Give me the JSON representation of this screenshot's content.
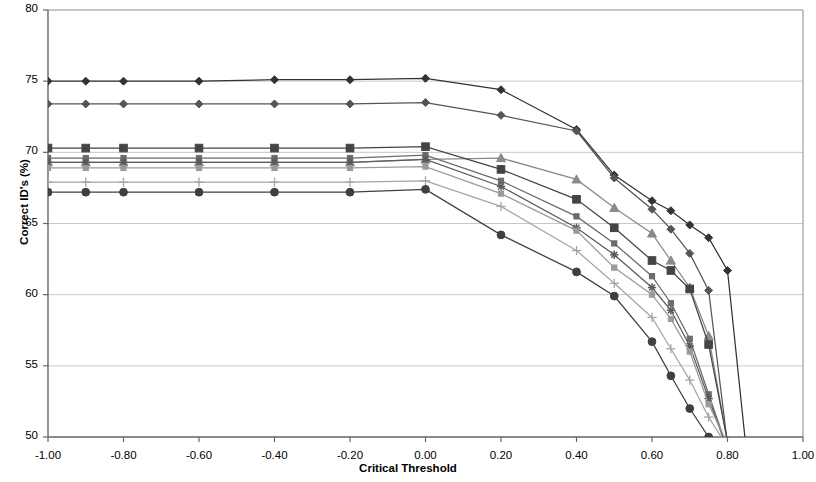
{
  "chart_data": {
    "type": "line",
    "title": "",
    "xlabel": "Critical Threshold",
    "ylabel": "Correct ID's (%)",
    "xlim": [
      -1.0,
      1.0
    ],
    "ylim": [
      50,
      80
    ],
    "xticks": [
      "-1.00",
      "-0.80",
      "-0.60",
      "-0.40",
      "-0.20",
      "0.00",
      "0.20",
      "0.40",
      "0.60",
      "0.80",
      "1.00"
    ],
    "xtick_values": [
      -1.0,
      -0.8,
      -0.6,
      -0.4,
      -0.2,
      0.0,
      0.2,
      0.4,
      0.5,
      0.6,
      0.8,
      1.0
    ],
    "yticks": [
      "50",
      "55",
      "60",
      "65",
      "70",
      "75",
      "80"
    ],
    "ytick_values": [
      50,
      55,
      60,
      65,
      70,
      75,
      80
    ],
    "grid": true,
    "grid_axis": "y",
    "legend": "none",
    "x": [
      -1.0,
      -0.9,
      -0.8,
      -0.6,
      -0.4,
      -0.2,
      0.0,
      0.2,
      0.4,
      0.5,
      0.6,
      0.65,
      0.7,
      0.75,
      0.8,
      0.85
    ],
    "series": [
      {
        "name": "series-1",
        "marker": "diamond",
        "color": "#333333",
        "values": [
          75.0,
          75.0,
          75.0,
          75.0,
          75.1,
          75.1,
          75.2,
          74.4,
          71.6,
          68.4,
          66.6,
          65.9,
          64.9,
          64.0,
          61.7,
          49.0
        ]
      },
      {
        "name": "series-2",
        "marker": "diamond",
        "color": "#555555",
        "values": [
          73.4,
          73.4,
          73.4,
          73.4,
          73.4,
          73.4,
          73.5,
          72.6,
          71.5,
          68.2,
          66.0,
          64.6,
          62.9,
          60.3,
          49.5,
          null
        ]
      },
      {
        "name": "series-3",
        "marker": "triangle",
        "color": "#8a8a8a",
        "values": [
          69.3,
          69.3,
          69.3,
          69.3,
          69.3,
          69.3,
          69.5,
          69.6,
          68.1,
          66.1,
          64.3,
          62.4,
          60.5,
          57.1,
          49.6,
          null
        ]
      },
      {
        "name": "series-4",
        "marker": "square",
        "color": "#444444",
        "values": [
          70.3,
          70.3,
          70.3,
          70.3,
          70.3,
          70.3,
          70.4,
          68.8,
          66.7,
          64.7,
          62.4,
          61.7,
          60.4,
          56.5,
          49.7,
          null
        ]
      },
      {
        "name": "series-5",
        "marker": "small-square",
        "color": "#6b6b6b",
        "values": [
          69.6,
          69.6,
          69.6,
          69.6,
          69.6,
          69.6,
          69.8,
          68.0,
          65.5,
          63.6,
          61.3,
          59.4,
          56.9,
          53.0,
          49.2,
          null
        ]
      },
      {
        "name": "series-6",
        "marker": "asterisk",
        "color": "#5a5a5a",
        "values": [
          69.3,
          69.3,
          69.3,
          69.3,
          69.3,
          69.3,
          69.5,
          67.6,
          64.7,
          62.8,
          60.5,
          58.9,
          56.4,
          52.7,
          49.1,
          null
        ]
      },
      {
        "name": "series-7",
        "marker": "small-square-light",
        "color": "#9a9a9a",
        "values": [
          68.9,
          68.9,
          68.9,
          68.9,
          68.9,
          68.9,
          69.0,
          67.1,
          64.5,
          61.9,
          60.0,
          58.3,
          56.0,
          52.3,
          49.5,
          null
        ]
      },
      {
        "name": "series-8",
        "marker": "plus",
        "color": "#a5a5a5",
        "values": [
          67.9,
          67.9,
          67.9,
          67.9,
          67.9,
          67.9,
          68.0,
          66.2,
          63.1,
          60.8,
          58.4,
          56.2,
          54.0,
          51.4,
          49.3,
          null
        ]
      },
      {
        "name": "series-9",
        "marker": "circle",
        "color": "#3f3f3f",
        "values": [
          67.2,
          67.2,
          67.2,
          67.2,
          67.2,
          67.2,
          67.4,
          64.2,
          61.6,
          59.9,
          56.7,
          54.3,
          52.0,
          50.0,
          48.8,
          null
        ]
      }
    ]
  }
}
